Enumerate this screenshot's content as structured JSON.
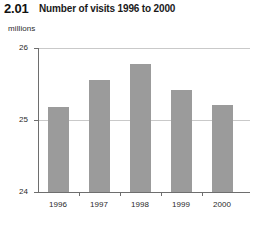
{
  "header": {
    "figure_number": "2.01",
    "title": "Number of visits 1996 to 2000"
  },
  "units": "millions",
  "axis": {
    "y_ticks": [
      "24",
      "25",
      "26"
    ],
    "x_ticks": [
      "1996",
      "1997",
      "1998",
      "1999",
      "2000"
    ]
  },
  "colors": {
    "bar_fill": "#9b9b9b",
    "gridline": "#c9c9c9",
    "axis": "#6e6e6e",
    "text": "#2a2a2a",
    "background": "#ffffff"
  },
  "chart_data": {
    "type": "bar",
    "title": "Number of visits 1996 to 2000",
    "subtitle": "2.01",
    "xlabel": "",
    "ylabel": "millions",
    "categories": [
      "1996",
      "1997",
      "1998",
      "1999",
      "2000"
    ],
    "values": [
      25.18,
      25.55,
      25.78,
      25.42,
      25.21
    ],
    "ylim": [
      24,
      26
    ],
    "ytick_values": [
      24,
      25,
      26
    ],
    "grid": true,
    "legend": "none",
    "series": [
      {
        "name": "Number of visits (millions)",
        "values": [
          25.18,
          25.55,
          25.78,
          25.42,
          25.21
        ]
      }
    ]
  }
}
